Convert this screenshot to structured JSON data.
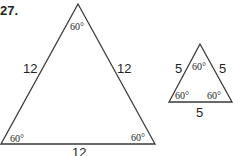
{
  "problem_number": "27.",
  "large_triangle": {
    "sides": {
      "left": "12",
      "right": "12",
      "bottom": "12"
    },
    "angles": {
      "top": "60°",
      "bottom_left": "60°",
      "bottom_right": "60°"
    }
  },
  "small_triangle": {
    "sides": {
      "left": "5",
      "right": "5",
      "bottom": "5"
    },
    "angles": {
      "top": "60°",
      "bottom_left": "60°",
      "bottom_right": "60°"
    }
  },
  "colors": {
    "stroke": "#3a3a3a",
    "text": "#231f20"
  }
}
